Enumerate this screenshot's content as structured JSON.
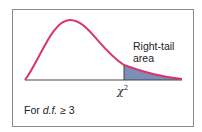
{
  "diagram": {
    "tail_label_line1": "Right-tail",
    "tail_label_line2": "area",
    "critical_symbol": "χ",
    "critical_exponent": "2",
    "note_prefix": "For ",
    "note_df": "d.f.",
    "note_suffix": " ≥ 3",
    "colors": {
      "curve": "#d9356a",
      "shade": "#7d8fb8",
      "axis": "#444444",
      "border": "#8a8a8a"
    }
  }
}
